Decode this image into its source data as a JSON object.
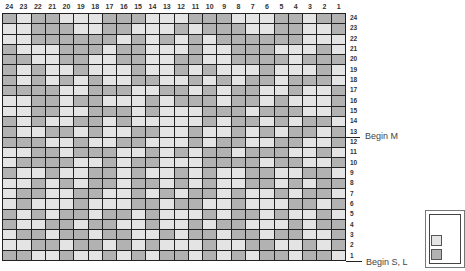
{
  "chart": {
    "columns": [
      "24",
      "23",
      "22",
      "21",
      "20",
      "19",
      "18",
      "17",
      "16",
      "15",
      "14",
      "13",
      "12",
      "11",
      "10",
      "9",
      "8",
      "7",
      "6",
      "5",
      "4",
      "3",
      "2",
      "1"
    ],
    "rows_top_to_bottom": [
      "24",
      "23",
      "22",
      "21",
      "20",
      "19",
      "18",
      "17",
      "16",
      "15",
      "14",
      "13",
      "12",
      "11",
      "10",
      "9",
      "8",
      "7",
      "6",
      "5",
      "4",
      "3",
      "2",
      "1"
    ],
    "colors": {
      "light": "#e4e4e4",
      "dark": "#b2b2b2",
      "grid_line": "#222222"
    },
    "cells": [
      "DLDDLLLDDDLLLDDDLLLDDLDD",
      "LLDDDLLDDLLLDLDDDLLDDLLD",
      "LLDDDDDDLDLDLDLDDDDDDLLL",
      "DLLLDDDLDDLLLDLLDDDLLLDL",
      "DDLLDDLLDDLLDDLLDDDDLDDD",
      "DLDLLDLLLDLLDLDLLLDLLLDL",
      "DLDLDLDLLDDLLDLDLDDLDDDL",
      "DDDDLLDDDLLDDLDLDDLLDLLD",
      "LLDDLDDLLLDLDDDLDDLDLLLD",
      "LLDDLLDDDLDLLLDDDLDDDLLD",
      "DLDLLDDLDLLLLLDLDDLDLDDL",
      "DLLDDLDLLDDLLDLLDLDLDDLD",
      "DDDLLDLLDDLLLDLDDLLDDLLD",
      "LLDDLDDDLLDLDLDDLDDDLLDL",
      "LDDDDLLDLDDLLLDDDDLDDLLD",
      "DLLDLLDDLDLLDLDLLDDLLDDL",
      "LLDLDLDDLDDLDLDLLDDLDLDD",
      "LDDLLDDLLDLDLDDLDLLDLDDL",
      "LDLLLDLLLDDLDDLLDLLLDDLD",
      "DLDLDDLDDLDLLLDLDDLDLLDL",
      "DLLDDLDDLLDLLDLDDLLLDLDD",
      "LDDLDDLDDLLDLDDLDDLDDLLD",
      "LLDDLDDLDLDLLLDLLDDLLDLD",
      "DDLLDLLDLDLDDLDLDLDDLDDL"
    ],
    "markers": [
      {
        "row": "13",
        "label": "Begin M"
      },
      {
        "row": "1",
        "label": "Begin S, L"
      }
    ]
  }
}
